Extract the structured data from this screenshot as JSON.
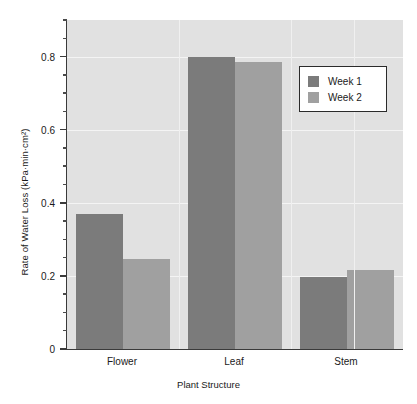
{
  "chart_data": {
    "type": "bar",
    "title": "",
    "subtitle": "",
    "xlabel": "Plant Structure",
    "ylabel": "Rate of Water Loss (kPa·min·cm²)",
    "categories": [
      "Flower",
      "Leaf",
      "Stem"
    ],
    "series": [
      {
        "name": "Week 1",
        "values": [
          0.37,
          0.8,
          0.197
        ],
        "color": "#7b7b7b"
      },
      {
        "name": "Week 2",
        "values": [
          0.245,
          0.785,
          0.217
        ],
        "color": "#a0a0a0"
      }
    ],
    "ylim": [
      0,
      0.9
    ],
    "xlim_note": "categorical",
    "ytick_labels": [
      "0",
      "0.2",
      "0.4",
      "0.6",
      "0.8"
    ],
    "ytick_values": [
      0,
      0.2,
      0.4,
      0.6,
      0.8
    ],
    "yminor_step": 0.05,
    "grid": "horizontal and vertical white gridlines on gray panel",
    "legend_position": "upper right",
    "plot_background": "#e1e1e1",
    "gridline_color": "#f4f4f4",
    "axis_color": "#3a3a3a"
  },
  "axes": {
    "y_title": "Rate of Water Loss (kPa·min·cm²)",
    "x_title": "Plant Structure"
  },
  "legend": {
    "entries": [
      {
        "label": "Week 1"
      },
      {
        "label": "Week 2"
      }
    ]
  }
}
